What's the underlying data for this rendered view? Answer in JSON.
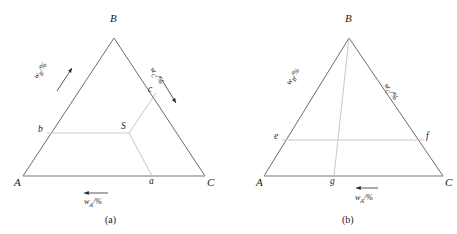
{
  "figure": {
    "background": "#ffffff",
    "edge_color": "#5a5a5a",
    "tie_line_color": "#c8c8c8",
    "text_color": "#1a1a1a"
  },
  "panels": [
    {
      "id": "a",
      "caption": "(a)",
      "vertices": [
        {
          "name": "A",
          "label": "A",
          "x": 23,
          "y": 176
        },
        {
          "name": "B",
          "label": "B",
          "x": 114,
          "y": 38
        },
        {
          "name": "C",
          "label": "C",
          "x": 205,
          "y": 176
        }
      ],
      "points": [
        {
          "name": "b",
          "label": "b",
          "x": 47,
          "y": 133
        },
        {
          "name": "S",
          "label": "S",
          "x": 129,
          "y": 133
        },
        {
          "name": "c",
          "label": "c",
          "x": 156,
          "y": 93
        },
        {
          "name": "a",
          "label": "a",
          "x": 152,
          "y": 176
        }
      ],
      "tie_lines": [
        {
          "name": "line-b-S",
          "from": "b",
          "to": "S"
        },
        {
          "name": "line-S-c",
          "from": "S",
          "to": "c"
        },
        {
          "name": "line-S-a",
          "from": "S",
          "to": "a"
        }
      ],
      "axes": [
        {
          "name": "axis-wB",
          "label": "w",
          "subscript": "B",
          "unit": "/%",
          "direction": "up-right",
          "arrow": true
        },
        {
          "name": "axis-wC",
          "label": "w",
          "subscript": "C",
          "unit": "/%",
          "direction": "down-right",
          "arrow": true
        },
        {
          "name": "axis-wA",
          "label": "w",
          "subscript": "A",
          "unit": "/%",
          "direction": "left",
          "arrow": true
        }
      ]
    },
    {
      "id": "b",
      "caption": "(b)",
      "vertices": [
        {
          "name": "A",
          "label": "A",
          "x": 264,
          "y": 176
        },
        {
          "name": "B",
          "label": "B",
          "x": 349,
          "y": 38
        },
        {
          "name": "C",
          "label": "C",
          "x": 443,
          "y": 176
        }
      ],
      "points": [
        {
          "name": "e",
          "label": "e",
          "x": 282,
          "y": 140
        },
        {
          "name": "f",
          "label": "f",
          "x": 424,
          "y": 140
        },
        {
          "name": "g",
          "label": "g",
          "x": 334,
          "y": 176
        }
      ],
      "tie_lines": [
        {
          "name": "line-e-f",
          "from": "e",
          "to": "f"
        },
        {
          "name": "line-B-g",
          "from": "B",
          "to": "g"
        }
      ],
      "axes": [
        {
          "name": "axis-wB",
          "label": "w",
          "subscript": "B",
          "unit": "/%",
          "direction": "up-right",
          "arrow": false
        },
        {
          "name": "axis-wC",
          "label": "w",
          "subscript": "C",
          "unit": "/%",
          "direction": "down-right",
          "arrow": false
        },
        {
          "name": "axis-wA",
          "label": "w",
          "subscript": "A",
          "unit": "/%",
          "direction": "left",
          "arrow": true
        }
      ]
    }
  ],
  "labels": {
    "wA_main": "w",
    "wA_sub": "A",
    "wA_unit": "/%",
    "wB_main": "w",
    "wB_sub": "B",
    "wB_unit": "/%",
    "wC_main": "w",
    "wC_sub": "C",
    "wC_unit": "/%"
  }
}
